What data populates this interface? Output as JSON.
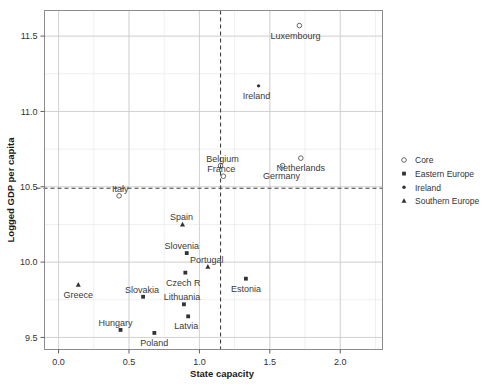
{
  "chart_data": {
    "type": "scatter",
    "title": "",
    "xlabel": "State capacity",
    "ylabel": "Logged GDP per capita",
    "xlim": [
      -0.1,
      2.3
    ],
    "ylim": [
      9.42,
      11.67
    ],
    "xticks": [
      "0.0",
      "0.5",
      "1.0",
      "1.5",
      "2.0"
    ],
    "xtick_values": [
      0.0,
      0.5,
      1.0,
      1.5,
      2.0
    ],
    "yticks": [
      "9.5",
      "10.0",
      "10.5",
      "11.0",
      "11.5"
    ],
    "ytick_values": [
      9.5,
      10.0,
      10.5,
      11.0,
      11.5
    ],
    "grid": true,
    "grid_minor_step_x": 0.25,
    "grid_minor_step_y": 0.25,
    "legend_position": "right",
    "reference_lines": [
      {
        "orientation": "vertical",
        "value": 1.15,
        "style": "dashed"
      },
      {
        "orientation": "horizontal",
        "value": 10.49,
        "style": "dashed"
      }
    ],
    "groups": [
      {
        "key": "core",
        "name": "Core",
        "marker": "open-circle"
      },
      {
        "key": "east",
        "name": "Eastern Europe",
        "marker": "filled-square"
      },
      {
        "key": "ire",
        "name": "Ireland",
        "marker": "filled-dot"
      },
      {
        "key": "south",
        "name": "Southern Europe",
        "marker": "filled-triangle"
      }
    ],
    "points": [
      {
        "label": "Luxembourg",
        "x": 1.71,
        "y": 11.57,
        "group": "core",
        "label_dx": -4,
        "label_dy": 13
      },
      {
        "label": "Ireland",
        "x": 1.42,
        "y": 11.17,
        "group": "ire",
        "label_dx": -2,
        "label_dy": 13
      },
      {
        "label": "Netherlands",
        "x": 1.72,
        "y": 10.69,
        "group": "core",
        "label_dx": 0,
        "label_dy": 13
      },
      {
        "label": "Germany",
        "x": 1.59,
        "y": 10.64,
        "group": "core",
        "label_dx": -1,
        "label_dy": 13
      },
      {
        "label": "Belgium",
        "x": 1.15,
        "y": 10.64,
        "group": "core",
        "label_dx": 2,
        "label_dy": -4
      },
      {
        "label": "France",
        "x": 1.17,
        "y": 10.57,
        "group": "core",
        "label_dx": -2,
        "label_dy": -4
      },
      {
        "label": "Italy",
        "x": 0.43,
        "y": 10.44,
        "group": "core",
        "label_dx": 1,
        "label_dy": -4
      },
      {
        "label": "Spain",
        "x": 0.88,
        "y": 10.25,
        "group": "south",
        "label_dx": -1,
        "label_dy": -4
      },
      {
        "label": "Slovenia",
        "x": 0.91,
        "y": 10.06,
        "group": "east",
        "label_dx": -5,
        "label_dy": -4
      },
      {
        "label": "Portugal",
        "x": 1.06,
        "y": 9.97,
        "group": "south",
        "label_dx": -1,
        "label_dy": -4
      },
      {
        "label": "Czech R",
        "x": 0.9,
        "y": 9.93,
        "group": "east",
        "label_dx": -2,
        "label_dy": 13
      },
      {
        "label": "Estonia",
        "x": 1.33,
        "y": 9.89,
        "group": "east",
        "label_dx": 0,
        "label_dy": 13
      },
      {
        "label": "Greece",
        "x": 0.14,
        "y": 9.85,
        "group": "south",
        "label_dx": 0,
        "label_dy": 13
      },
      {
        "label": "Slovakia",
        "x": 0.6,
        "y": 9.77,
        "group": "east",
        "label_dx": -1,
        "label_dy": -4
      },
      {
        "label": "Lithuania",
        "x": 0.89,
        "y": 9.72,
        "group": "east",
        "label_dx": -2,
        "label_dy": -4
      },
      {
        "label": "Latvia",
        "x": 0.92,
        "y": 9.64,
        "group": "east",
        "label_dx": -2,
        "label_dy": 13
      },
      {
        "label": "Hungary",
        "x": 0.44,
        "y": 9.55,
        "group": "east",
        "label_dx": -5,
        "label_dy": -4
      },
      {
        "label": "Poland",
        "x": 0.68,
        "y": 9.53,
        "group": "east",
        "label_dx": 0,
        "label_dy": 13
      }
    ]
  },
  "legend": {
    "items": [
      {
        "label": "Core"
      },
      {
        "label": "Eastern Europe"
      },
      {
        "label": "Ireland"
      },
      {
        "label": "Southern Europe"
      }
    ]
  }
}
